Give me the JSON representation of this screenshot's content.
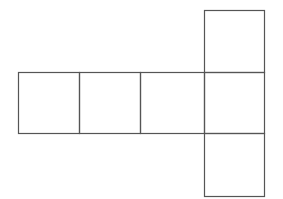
{
  "diagram": {
    "type": "cube-net",
    "stroke_color": "#555555",
    "background": "#ffffff",
    "faces": [
      {
        "id": "row-1",
        "x": 18,
        "y": 72,
        "w": 61,
        "h": 61
      },
      {
        "id": "row-2",
        "x": 79,
        "y": 72,
        "w": 61,
        "h": 61
      },
      {
        "id": "row-3",
        "x": 140,
        "y": 72,
        "w": 64,
        "h": 61
      },
      {
        "id": "row-4",
        "x": 204,
        "y": 72,
        "w": 60,
        "h": 61
      },
      {
        "id": "top",
        "x": 204,
        "y": 10,
        "w": 60,
        "h": 62
      },
      {
        "id": "bottom",
        "x": 204,
        "y": 133,
        "w": 60,
        "h": 63
      }
    ]
  }
}
